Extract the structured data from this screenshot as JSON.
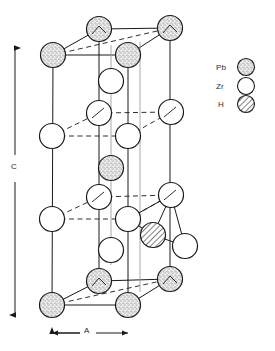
{
  "figure": {
    "type": "crystal-structure-unit-cell",
    "background_color": "#ffffff",
    "line_color": "#1a1a1a"
  },
  "axes": {
    "c_axis": {
      "label": "C",
      "orientation": "vertical",
      "arrowheads": "both"
    },
    "a_axis": {
      "label": "A",
      "orientation": "horizontal",
      "arrowheads": "both"
    }
  },
  "legend": {
    "items": [
      {
        "label": "Pb",
        "style": "stippled",
        "fill": "#f2f2f2",
        "stroke": "#1a1a1a"
      },
      {
        "label": "Zr",
        "style": "open",
        "fill": "#ffffff",
        "stroke": "#1a1a1a"
      },
      {
        "label": "H",
        "style": "hatched",
        "fill": "#ffffff",
        "stroke": "#1a1a1a"
      }
    ]
  },
  "atoms": [
    {
      "id": "pb-top-back-left",
      "element": "Pb",
      "cx": 99,
      "cy": 29,
      "r": 12.5
    },
    {
      "id": "pb-top-back-right",
      "element": "Pb",
      "cx": 170,
      "cy": 28,
      "r": 12.5
    },
    {
      "id": "pb-top-front-left",
      "element": "Pb",
      "cx": 53,
      "cy": 55,
      "r": 12.5
    },
    {
      "id": "pb-top-front-right",
      "element": "Pb",
      "cx": 128,
      "cy": 55,
      "r": 12.5
    },
    {
      "id": "zr-upper-axial",
      "element": "Zr",
      "cx": 111,
      "cy": 81,
      "r": 12.5
    },
    {
      "id": "zr-upper-back-left",
      "element": "Zr",
      "cx": 99,
      "cy": 113,
      "r": 12.5
    },
    {
      "id": "zr-upper-back-right",
      "element": "Zr",
      "cx": 171,
      "cy": 112,
      "r": 12.5
    },
    {
      "id": "zr-upper-front-left",
      "element": "Zr",
      "cx": 52,
      "cy": 136,
      "r": 12.5
    },
    {
      "id": "zr-upper-front-right",
      "element": "Zr",
      "cx": 128,
      "cy": 136,
      "r": 12.5
    },
    {
      "id": "pb-mid-axial",
      "element": "Pb",
      "cx": 111,
      "cy": 168,
      "r": 12.5
    },
    {
      "id": "zr-lower-back-left",
      "element": "Zr",
      "cx": 99,
      "cy": 197,
      "r": 12.5
    },
    {
      "id": "zr-lower-back-right",
      "element": "Zr",
      "cx": 171,
      "cy": 195,
      "r": 12.5
    },
    {
      "id": "zr-lower-front-left",
      "element": "Zr",
      "cx": 52,
      "cy": 219,
      "r": 12.5
    },
    {
      "id": "zr-lower-front-right",
      "element": "Zr",
      "cx": 128,
      "cy": 219,
      "r": 12.5
    },
    {
      "id": "h-interstitial",
      "element": "H",
      "cx": 153,
      "cy": 235,
      "r": 12.5
    },
    {
      "id": "zr-right-outer",
      "element": "Zr",
      "cx": 185,
      "cy": 246,
      "r": 12.5
    },
    {
      "id": "zr-lower-axial",
      "element": "Zr",
      "cx": 111,
      "cy": 250,
      "r": 12.5
    },
    {
      "id": "pb-bot-back-left",
      "element": "Pb",
      "cx": 99,
      "cy": 281,
      "r": 12.5
    },
    {
      "id": "pb-bot-back-right",
      "element": "Pb",
      "cx": 170,
      "cy": 279,
      "r": 12.5
    },
    {
      "id": "pb-bot-front-left",
      "element": "Pb",
      "cx": 52,
      "cy": 305,
      "r": 12.5
    },
    {
      "id": "pb-bot-front-right",
      "element": "Pb",
      "cx": 128,
      "cy": 305,
      "r": 12.5
    }
  ]
}
